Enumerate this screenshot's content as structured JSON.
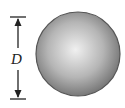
{
  "diagram": {
    "dimension_label": "D",
    "sphere": {
      "cx": 78,
      "cy": 54,
      "r": 42,
      "highlight_color": "#f0f0f0",
      "edge_color": "#555555"
    },
    "dimension_line": {
      "x": 18,
      "y_top": 17,
      "y_bottom": 99,
      "color": "#222222"
    }
  }
}
